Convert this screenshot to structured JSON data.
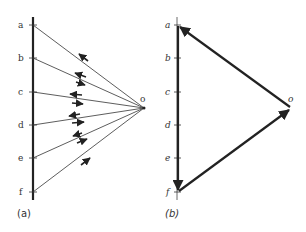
{
  "panels": [
    {
      "caption": "(a)",
      "points": [
        {
          "label": "a",
          "y": 25
        },
        {
          "label": "b",
          "y": 58
        },
        {
          "label": "c",
          "y": 92
        },
        {
          "label": "d",
          "y": 125
        },
        {
          "label": "e",
          "y": 158
        },
        {
          "label": "f",
          "y": 192
        }
      ],
      "origin_label": "o"
    },
    {
      "caption": "(b)",
      "points": [
        {
          "label": "a",
          "y": 25
        },
        {
          "label": "b",
          "y": 58
        },
        {
          "label": "c",
          "y": 92
        },
        {
          "label": "d",
          "y": 125
        },
        {
          "label": "e",
          "y": 158
        },
        {
          "label": "f",
          "y": 192
        }
      ],
      "origin_label": "o"
    }
  ],
  "colors": {
    "line": "#333333",
    "thick": "#222222",
    "background": "#ffffff"
  }
}
